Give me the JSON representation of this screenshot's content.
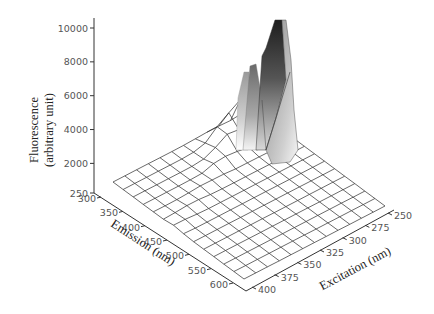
{
  "chart_data": {
    "type": "surface3d",
    "title": "",
    "zlabel_line1": "Fluorescence",
    "zlabel_line2": "(arbitrary unit)",
    "xlabel": "Emission (nm)",
    "ylabel": "Excitation (nm)",
    "z_ticks": [
      "10000",
      "8000",
      "6000",
      "4000",
      "2000",
      "250"
    ],
    "z_tick_values": [
      10000,
      8000,
      6000,
      4000,
      2000,
      250
    ],
    "zlim": [
      250,
      10000
    ],
    "emission_ticks": [
      "300",
      "350",
      "400",
      "450",
      "500",
      "550",
      "600"
    ],
    "emission_tick_values": [
      300,
      350,
      400,
      450,
      500,
      550,
      600
    ],
    "excitation_ticks": [
      "250",
      "275",
      "300",
      "325",
      "350",
      "375",
      "400"
    ],
    "excitation_tick_values": [
      250,
      275,
      300,
      325,
      350,
      375,
      400
    ],
    "grid": {
      "emission": [
        300,
        325,
        350,
        375,
        400,
        425,
        450,
        475,
        500,
        525,
        550,
        575,
        600,
        625
      ],
      "excitation": [
        250,
        262.5,
        275,
        287.5,
        300,
        312.5,
        325,
        337.5,
        350,
        362.5,
        375,
        387.5,
        400
      ]
    },
    "peak": {
      "emission": 330,
      "excitation": 270,
      "fluorescence": 10000
    },
    "secondary_peaks": [
      {
        "emission": 320,
        "excitation": 285,
        "fluorescence": 6800
      },
      {
        "emission": 315,
        "excitation": 300,
        "fluorescence": 5600
      }
    ],
    "background_level": 250,
    "grid_on": false,
    "legend": "none"
  }
}
